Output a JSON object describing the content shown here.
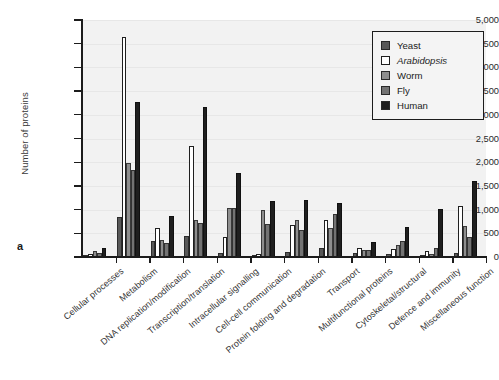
{
  "panel": {
    "letter": "a"
  },
  "axes": {
    "ylabel": "Number of proteins",
    "yticks": [
      "0",
      "500",
      "1,000",
      "1,500",
      "2,000",
      "2,500",
      "3,000",
      "3,500",
      "4,000",
      "4,500",
      "5,000"
    ]
  },
  "legend": {
    "items": [
      {
        "label": "Yeast",
        "color": "#595959",
        "italic": false
      },
      {
        "label": "Arabidopsis",
        "color": "#ffffff",
        "italic": true
      },
      {
        "label": "Worm",
        "color": "#8e8e8e",
        "italic": false
      },
      {
        "label": "Fly",
        "color": "#737373",
        "italic": false
      },
      {
        "label": "Human",
        "color": "#1f1f1f",
        "italic": false
      }
    ]
  },
  "chart_data": {
    "type": "bar",
    "title": "",
    "xlabel": "",
    "ylabel": "Number of proteins",
    "ylim": [
      0,
      5000
    ],
    "ytick_step": 500,
    "grid": true,
    "legend_position": "top-right",
    "categories": [
      "Cellular processes",
      "Metabolism",
      "DNA replication/modification",
      "Transcription/translation",
      "Intracellular signalling",
      "Cell-cell communication",
      "Protein folding and degradation",
      "Transport",
      "Multifunctional proteins",
      "Cytoskeletal/structural",
      "Defence and immunity",
      "Miscellaneous function"
    ],
    "series": [
      {
        "name": "Yeast",
        "values": [
          50,
          850,
          330,
          440,
          90,
          40,
          110,
          200,
          80,
          60,
          40,
          90
        ]
      },
      {
        "name": "Arabidopsis",
        "values": [
          70,
          4650,
          620,
          2340,
          420,
          70,
          680,
          780,
          190,
          170,
          130,
          1080
        ]
      },
      {
        "name": "Worm",
        "values": [
          130,
          1980,
          360,
          790,
          1030,
          990,
          780,
          620,
          140,
          250,
          60,
          660
        ]
      },
      {
        "name": "Fly",
        "values": [
          80,
          1830,
          300,
          720,
          1040,
          700,
          580,
          900,
          140,
          330,
          180,
          430
        ]
      },
      {
        "name": "Human",
        "values": [
          190,
          3270,
          870,
          3160,
          1780,
          1190,
          1200,
          1130,
          310,
          640,
          1020,
          1600
        ]
      }
    ]
  }
}
